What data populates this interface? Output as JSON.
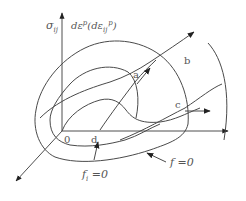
{
  "figure": {
    "type": "yield surface diagram",
    "axes": {
      "vertical_label_left": "σ",
      "vertical_label_left_sub": "ij",
      "vertical_label_right_main": "dε",
      "vertical_label_right_sup": "p",
      "vertical_label_right_paren_open": "(dε",
      "vertical_label_right_paren_sub": "ij",
      "vertical_label_right_paren_sup": "p",
      "vertical_label_right_paren_close": ")"
    },
    "origin_label": "0",
    "points": {
      "a": "a",
      "b": "b",
      "c": "c",
      "d": "d"
    },
    "surfaces": {
      "outer_label": "f =0",
      "inner_label_f": "f",
      "inner_label_sub": "i",
      "inner_label_eq": " =0"
    },
    "colors": {
      "line": "#4a4a4a",
      "text": "#555555",
      "background": "#ffffff"
    }
  }
}
